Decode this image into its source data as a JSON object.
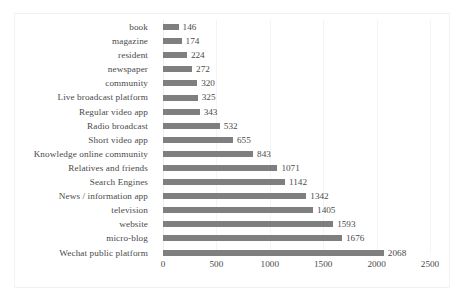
{
  "chart_data": {
    "type": "bar",
    "orientation": "horizontal",
    "title": "",
    "subtitle": "",
    "xlabel": "",
    "ylabel": "",
    "xlim": [
      0,
      2500
    ],
    "xticks": [
      0,
      500,
      1000,
      1500,
      2000,
      2500
    ],
    "xtick_labels": [
      "0",
      "500",
      "1000",
      "1500",
      "2000",
      "2500"
    ],
    "grid": "vertical",
    "legend": "none",
    "bar_color": "#7f7f7f",
    "data_labels": true,
    "categories": [
      "book",
      "magazine",
      "resident",
      "newspaper",
      "community",
      "Live broadcast platform",
      "Regular video app",
      "Radio broadcast",
      "Short video app",
      "Knowledge online community",
      "Relatives and friends",
      "Search Engines",
      "News / information app",
      "television",
      "website",
      "micro-blog",
      "Wechat public platform"
    ],
    "values": [
      146,
      174,
      224,
      272,
      320,
      325,
      343,
      532,
      655,
      843,
      1071,
      1142,
      1342,
      1405,
      1593,
      1676,
      2068
    ],
    "value_labels": [
      "146",
      "174",
      "224",
      "272",
      "320",
      "325",
      "343",
      "532",
      "655",
      "843",
      "1071",
      "1142",
      "1342",
      "1405",
      "1593",
      "1676",
      "2068"
    ]
  }
}
